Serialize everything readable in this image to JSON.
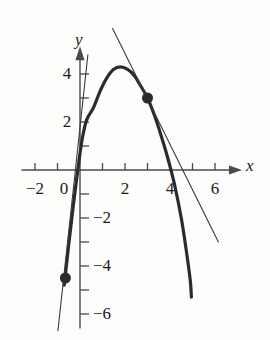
{
  "figure": {
    "kind": "math-graph",
    "axis_x_label": "x",
    "axis_y_label": "y",
    "background_color": "#fdfdfb",
    "curve_color": "#2b2b2b",
    "line_color": "#3a3a3a",
    "axis_color": "#4a4a4a"
  },
  "axes": {
    "origin_px": {
      "x": 80,
      "y": 170
    },
    "unit_px": {
      "x": 22.5,
      "y": 24
    },
    "x_ticks": [
      -2,
      -1,
      0,
      1,
      2,
      3,
      4,
      5,
      6
    ],
    "x_tick_labels": [
      {
        "value": -2,
        "text": "−2"
      },
      {
        "value": 0,
        "text": "0"
      },
      {
        "value": 2,
        "text": "2"
      },
      {
        "value": 4,
        "text": "4"
      },
      {
        "value": 6,
        "text": "6"
      }
    ],
    "y_ticks": [
      -6,
      -5,
      -4,
      -3,
      -2,
      -1,
      1,
      2,
      3,
      4
    ],
    "y_tick_labels": [
      {
        "value": 4,
        "text": "4"
      },
      {
        "value": 2,
        "text": "2"
      },
      {
        "value": -2,
        "text": "−2"
      },
      {
        "value": -4,
        "text": "−4"
      },
      {
        "value": -6,
        "text": "−6"
      }
    ],
    "x_range": [
      -2.6,
      7.2
    ],
    "y_range": [
      -6.6,
      5.2
    ]
  },
  "chart_data": {
    "type": "line",
    "title": "",
    "xlabel": "x",
    "ylabel": "y",
    "xlim": [
      -2.6,
      7.2
    ],
    "ylim": [
      -6.6,
      5.2
    ],
    "grid": false,
    "legend": "none",
    "series": [
      {
        "name": "parabola",
        "role": "curve",
        "stroke_width": 3.2,
        "vertex": {
          "x": 1.8,
          "y": 4.3
        },
        "x_intercepts": [
          -0.28,
          4.3
        ],
        "x_domain": [
          -0.7,
          4.9
        ],
        "points": [
          {
            "x": -0.7,
            "y": -4.8
          },
          {
            "x": -0.5,
            "y": -3.1
          },
          {
            "x": -0.3,
            "y": -1.5
          },
          {
            "x": -0.1,
            "y": 0.0
          },
          {
            "x": 0.1,
            "y": 1.3
          },
          {
            "x": 0.3,
            "y": 2.1
          },
          {
            "x": 0.6,
            "y": 2.6
          },
          {
            "x": 0.9,
            "y": 3.3
          },
          {
            "x": 1.2,
            "y": 3.85
          },
          {
            "x": 1.5,
            "y": 4.2
          },
          {
            "x": 1.8,
            "y": 4.3
          },
          {
            "x": 2.1,
            "y": 4.2
          },
          {
            "x": 2.4,
            "y": 3.95
          },
          {
            "x": 2.7,
            "y": 3.5
          },
          {
            "x": 3.0,
            "y": 3.0
          },
          {
            "x": 3.3,
            "y": 2.3
          },
          {
            "x": 3.6,
            "y": 1.45
          },
          {
            "x": 3.9,
            "y": 0.5
          },
          {
            "x": 4.2,
            "y": -0.6
          },
          {
            "x": 4.5,
            "y": -2.0
          },
          {
            "x": 4.7,
            "y": -3.2
          },
          {
            "x": 4.9,
            "y": -4.6
          },
          {
            "x": 4.95,
            "y": -5.3
          }
        ]
      },
      {
        "name": "tangent-line-at-3",
        "role": "straight-line",
        "stroke_width": 1.1,
        "through": {
          "x": 3,
          "y": 3
        },
        "slope": -2.1,
        "endpoints": [
          {
            "x": 1.45,
            "y": 5.9
          },
          {
            "x": 6.15,
            "y": -3.0
          }
        ]
      },
      {
        "name": "tangent-line-at-minus-0-65",
        "role": "straight-line",
        "stroke_width": 1.1,
        "through": {
          "x": -0.65,
          "y": -4.5
        },
        "slope": 9.2,
        "endpoints": [
          {
            "x": 0.35,
            "y": 4.8
          },
          {
            "x": -0.98,
            "y": -6.7
          }
        ]
      }
    ],
    "points": [
      {
        "name": "tangency-point-upper",
        "x": 3,
        "y": 3,
        "marker": "filled-circle",
        "radius_px": 5.5
      },
      {
        "name": "tangency-point-lower",
        "x": -0.65,
        "y": -4.5,
        "marker": "filled-circle",
        "radius_px": 5.5
      }
    ],
    "annotations": []
  }
}
